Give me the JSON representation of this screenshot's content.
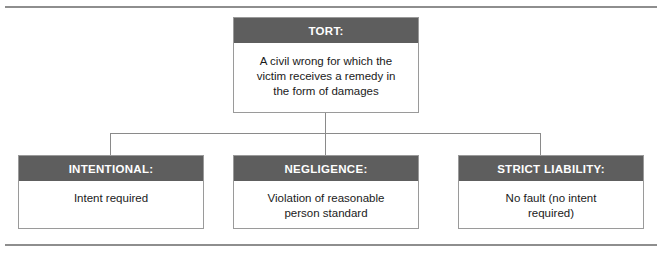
{
  "diagram": {
    "root": {
      "title": "TORT:",
      "description": "A civil wrong for which the\nvictim receives a remedy in\nthe form of damages"
    },
    "branches": [
      {
        "title": "INTENTIONAL:",
        "description": "Intent required"
      },
      {
        "title": "NEGLIGENCE:",
        "description": "Violation of reasonable\nperson standard"
      },
      {
        "title": "STRICT LIABILITY:",
        "description": "No fault (no intent\nrequired)"
      }
    ]
  },
  "colors": {
    "header_fill": "#5e5e5e",
    "header_text": "#ffffff",
    "body_fill": "#ffffff",
    "body_text": "#1a1a1a",
    "border": "#9a9a9a",
    "rule": "#8e8e8e",
    "connector": "#8a8a8a"
  }
}
